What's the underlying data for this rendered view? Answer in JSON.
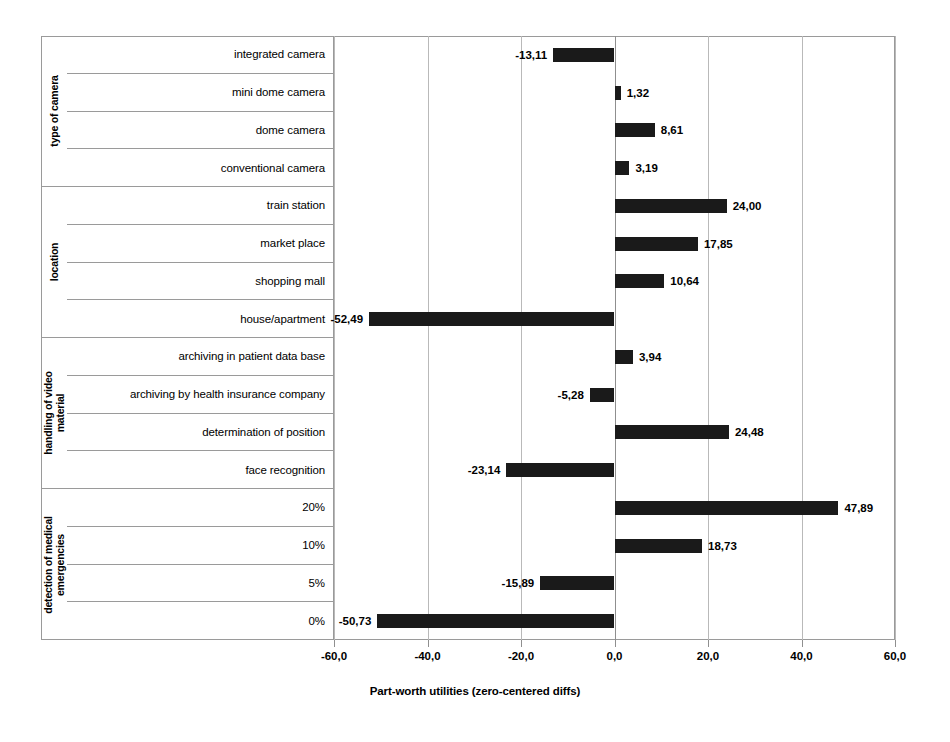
{
  "chart_data": {
    "type": "bar",
    "orientation": "horizontal",
    "title": "",
    "xlabel": "Part-worth utilities (zero-centered diffs)",
    "ylabel": "",
    "xlim": [
      -60.0,
      60.0
    ],
    "xticks": [
      -60.0,
      -40.0,
      -20.0,
      0.0,
      20.0,
      40.0,
      60.0
    ],
    "xtick_labels": [
      "-60,0",
      "-40,0",
      "-20,0",
      "0,0",
      "20,0",
      "40,0",
      "60,0"
    ],
    "grid": true,
    "legend": false,
    "decimal_separator": ",",
    "bar_color": "#1a1a1a",
    "groups": [
      {
        "name": "type of camera",
        "name_lines": [
          "type of camera"
        ],
        "levels": [
          {
            "label": "integrated camera",
            "value": -13.11,
            "value_label": "-13,11"
          },
          {
            "label": "mini dome camera",
            "value": 1.32,
            "value_label": "1,32"
          },
          {
            "label": "dome camera",
            "value": 8.61,
            "value_label": "8,61"
          },
          {
            "label": "conventional camera",
            "value": 3.19,
            "value_label": "3,19"
          }
        ]
      },
      {
        "name": "location",
        "name_lines": [
          "location"
        ],
        "levels": [
          {
            "label": "train station",
            "value": 24.0,
            "value_label": "24,00"
          },
          {
            "label": "market place",
            "value": 17.85,
            "value_label": "17,85"
          },
          {
            "label": "shopping mall",
            "value": 10.64,
            "value_label": "10,64"
          },
          {
            "label": "house/apartment",
            "value": -52.49,
            "value_label": "-52,49"
          }
        ]
      },
      {
        "name": "handling of video material",
        "name_lines": [
          "handling of video",
          "material"
        ],
        "levels": [
          {
            "label": "archiving in patient data base",
            "value": 3.94,
            "value_label": "3,94"
          },
          {
            "label": "archiving by health insurance company",
            "value": -5.28,
            "value_label": "-5,28"
          },
          {
            "label": "determination of position",
            "value": 24.48,
            "value_label": "24,48"
          },
          {
            "label": "face recognition",
            "value": -23.14,
            "value_label": "-23,14"
          }
        ]
      },
      {
        "name": "detection of medical emergencies",
        "name_lines": [
          "detection of medical",
          "emergencies"
        ],
        "levels": [
          {
            "label": "20%",
            "value": 47.89,
            "value_label": "47,89"
          },
          {
            "label": "10%",
            "value": 18.73,
            "value_label": "18,73"
          },
          {
            "label": "5%",
            "value": -15.89,
            "value_label": "-15,89"
          },
          {
            "label": "0%",
            "value": -50.73,
            "value_label": "-50,73"
          }
        ]
      }
    ]
  }
}
